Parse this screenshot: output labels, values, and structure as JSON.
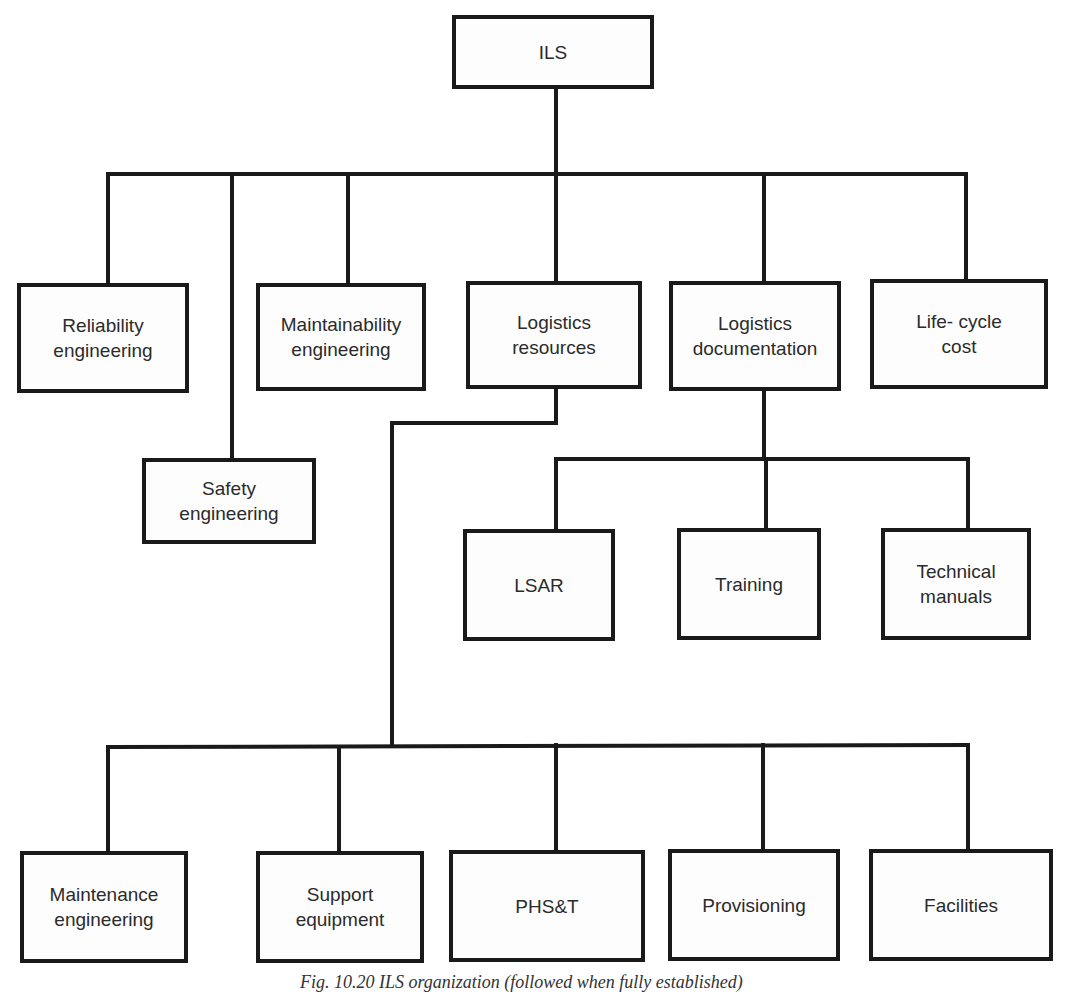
{
  "diagram": {
    "type": "organization-tree",
    "root": "ILS",
    "nodes": {
      "ils": "ILS",
      "reliability": "Reliability\nengineering",
      "safety": "Safety\nengineering",
      "maintainability": "Maintainability\nengineering",
      "logistics_resources": "Logistics\nresources",
      "logistics_documentation": "Logistics\ndocumentation",
      "life_cycle_cost": "Life- cycle\ncost",
      "lsar": "LSAR",
      "training": "Training",
      "technical_manuals": "Technical\nmanuals",
      "maintenance_engineering": "Maintenance\nengineering",
      "support_equipment": "Support\nequipment",
      "phst": "PHS&T",
      "provisioning": "Provisioning",
      "facilities": "Facilities"
    },
    "edges": [
      [
        "ILS",
        "Reliability engineering"
      ],
      [
        "ILS",
        "Safety engineering"
      ],
      [
        "ILS",
        "Maintainability engineering"
      ],
      [
        "ILS",
        "Logistics resources"
      ],
      [
        "ILS",
        "Logistics documentation"
      ],
      [
        "ILS",
        "Life-cycle cost"
      ],
      [
        "Logistics documentation",
        "LSAR"
      ],
      [
        "Logistics documentation",
        "Training"
      ],
      [
        "Logistics documentation",
        "Technical manuals"
      ],
      [
        "Logistics resources",
        "Maintenance engineering"
      ],
      [
        "Logistics resources",
        "Support equipment"
      ],
      [
        "Logistics resources",
        "PHS&T"
      ],
      [
        "Logistics resources",
        "Provisioning"
      ],
      [
        "Logistics resources",
        "Facilities"
      ]
    ],
    "caption": "Fig. 10.20 ILS organization (followed when fully established)"
  }
}
